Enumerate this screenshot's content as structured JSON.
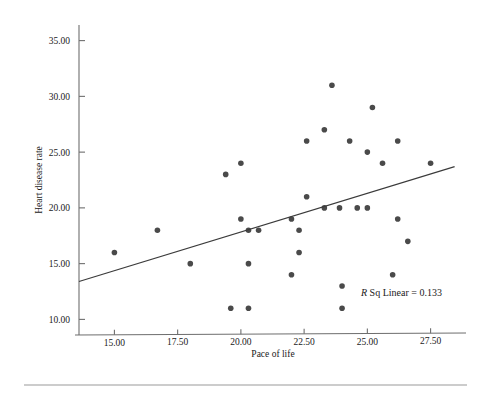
{
  "chart_data": {
    "type": "scatter",
    "title": "",
    "xlabel": "Pace of life",
    "ylabel": "Heart disease rate",
    "xlim": [
      13.6,
      28.9
    ],
    "ylim": [
      8.6,
      36.4
    ],
    "xticks": [
      15.0,
      17.5,
      20.0,
      22.5,
      25.0,
      27.5
    ],
    "xtick_labels": [
      "15.00",
      "17.50",
      "20.00",
      "22.50",
      "25.00",
      "27.50"
    ],
    "yticks": [
      10.0,
      15.0,
      20.0,
      25.0,
      30.0,
      35.0
    ],
    "ytick_labels": [
      "10.00",
      "15.00",
      "20.00",
      "25.00",
      "30.00",
      "35.00"
    ],
    "grid": false,
    "legend": false,
    "point_color": "#4a4a4a",
    "line_color": "#3b3b3b",
    "axis_color": "#6e6e6e",
    "annotation": {
      "text_italic": "R",
      "text": " Sq Linear = 0.133",
      "full_text": "R Sq Linear = 0.133",
      "x": 25.0,
      "y": 12.6
    },
    "fit_line": {
      "x_start": 13.6,
      "y_start": 13.4,
      "x_end": 28.45,
      "y_end": 23.7
    },
    "points": [
      {
        "x": 15.0,
        "y": 16.0
      },
      {
        "x": 16.7,
        "y": 18.0
      },
      {
        "x": 18.0,
        "y": 15.0
      },
      {
        "x": 19.4,
        "y": 23.0
      },
      {
        "x": 19.6,
        "y": 11.0
      },
      {
        "x": 20.0,
        "y": 24.0
      },
      {
        "x": 20.0,
        "y": 19.0
      },
      {
        "x": 20.3,
        "y": 18.0
      },
      {
        "x": 20.3,
        "y": 15.0
      },
      {
        "x": 20.3,
        "y": 11.0
      },
      {
        "x": 20.7,
        "y": 18.0
      },
      {
        "x": 22.0,
        "y": 19.0
      },
      {
        "x": 22.0,
        "y": 14.0
      },
      {
        "x": 22.3,
        "y": 18.0
      },
      {
        "x": 22.3,
        "y": 16.0
      },
      {
        "x": 22.6,
        "y": 26.0
      },
      {
        "x": 22.6,
        "y": 21.0
      },
      {
        "x": 23.3,
        "y": 27.0
      },
      {
        "x": 23.3,
        "y": 20.0
      },
      {
        "x": 23.6,
        "y": 31.0
      },
      {
        "x": 23.9,
        "y": 20.0
      },
      {
        "x": 24.0,
        "y": 13.0
      },
      {
        "x": 24.0,
        "y": 11.0
      },
      {
        "x": 24.3,
        "y": 26.0
      },
      {
        "x": 24.6,
        "y": 20.0
      },
      {
        "x": 25.0,
        "y": 25.0
      },
      {
        "x": 25.0,
        "y": 20.0
      },
      {
        "x": 25.2,
        "y": 29.0
      },
      {
        "x": 25.6,
        "y": 24.0
      },
      {
        "x": 26.0,
        "y": 14.0
      },
      {
        "x": 26.2,
        "y": 26.0
      },
      {
        "x": 26.2,
        "y": 19.0
      },
      {
        "x": 26.6,
        "y": 17.0
      },
      {
        "x": 27.5,
        "y": 24.0
      }
    ]
  }
}
